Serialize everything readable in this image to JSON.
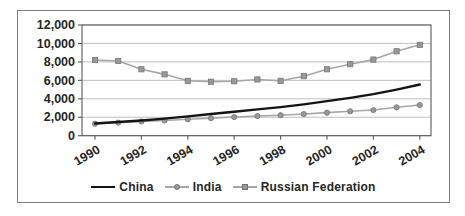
{
  "frame": {
    "background": "#ffffff",
    "border_color": "#7f7f7f"
  },
  "colors": {
    "gridline": "#b8b8b8",
    "axis": "#595959",
    "text": "#262626",
    "gray_line": "#a6a6a6",
    "marker_fill": "#999999",
    "marker_stroke": "#757575",
    "china_line": "#141414"
  },
  "chart_data": {
    "type": "line",
    "title": "",
    "xlabel": "",
    "ylabel": "",
    "grid": true,
    "legend_position": "bottom",
    "ylim": [
      0,
      12000
    ],
    "y_tick_step": 2000,
    "y_ticks": [
      {
        "value": 0,
        "label": "0"
      },
      {
        "value": 2000,
        "label": "2,000"
      },
      {
        "value": 4000,
        "label": "4,000"
      },
      {
        "value": 6000,
        "label": "6,000"
      },
      {
        "value": 8000,
        "label": "8,000"
      },
      {
        "value": 10000,
        "label": "10,000"
      },
      {
        "value": 12000,
        "label": "12,000"
      }
    ],
    "x": [
      1990,
      1991,
      1992,
      1993,
      1994,
      1995,
      1996,
      1997,
      1998,
      1999,
      2000,
      2001,
      2002,
      2003,
      2004
    ],
    "x_ticks": [
      {
        "value": 1990,
        "label": "1990"
      },
      {
        "value": 1992,
        "label": "1992"
      },
      {
        "value": 1994,
        "label": "1994"
      },
      {
        "value": 1996,
        "label": "1996"
      },
      {
        "value": 1998,
        "label": "1998"
      },
      {
        "value": 2000,
        "label": "2000"
      },
      {
        "value": 2002,
        "label": "2002"
      },
      {
        "value": 2004,
        "label": "2004"
      }
    ],
    "series": [
      {
        "name": "Russian Federation",
        "marker": "square",
        "color": "#a6a6a6",
        "line_width": 1.6,
        "values": [
          8200,
          8100,
          7200,
          6650,
          5950,
          5850,
          5900,
          6100,
          5950,
          6450,
          7200,
          7750,
          8250,
          9150,
          9850
        ]
      },
      {
        "name": "India",
        "marker": "circle",
        "color": "#a6a6a6",
        "line_width": 1.6,
        "values": [
          1300,
          1420,
          1540,
          1650,
          1780,
          1900,
          2020,
          2130,
          2220,
          2350,
          2500,
          2650,
          2780,
          3080,
          3330
        ]
      },
      {
        "name": "China",
        "marker": "none",
        "color": "#141414",
        "line_width": 2.4,
        "values": [
          1320,
          1480,
          1650,
          1850,
          2100,
          2350,
          2600,
          2850,
          3100,
          3400,
          3750,
          4100,
          4500,
          5000,
          5550
        ]
      }
    ],
    "legend_order": [
      "China",
      "India",
      "Russian Federation"
    ]
  },
  "legend": {
    "china_label": "China",
    "india_label": "India",
    "russia_label": "Russian Federation"
  }
}
